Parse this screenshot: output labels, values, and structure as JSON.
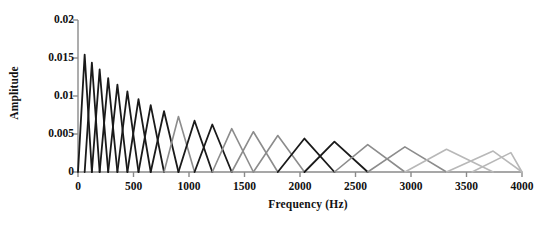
{
  "chart": {
    "title": "",
    "xlabel": "Frequency (Hz)",
    "ylabel": "Amplitude",
    "xticklabels": [
      "0",
      "500",
      "1000",
      "1500",
      "2000",
      "2500",
      "3000",
      "3500",
      "4000"
    ],
    "yticklabels": [
      "0",
      "0.005",
      "0.01",
      "0.015",
      "0.02"
    ]
  },
  "chart_data": {
    "type": "line",
    "title": "",
    "xlabel": "Frequency (Hz)",
    "ylabel": "Amplitude",
    "xlim": [
      0,
      4000
    ],
    "ylim": [
      0,
      0.02
    ],
    "xticks": [
      0,
      500,
      1000,
      1500,
      2000,
      2500,
      3000,
      3500,
      4000
    ],
    "yticks": [
      0,
      0.005,
      0.01,
      0.015,
      0.02
    ],
    "xticklabels": [
      "0",
      "500",
      "1000",
      "1500",
      "2000",
      "2500",
      "3000",
      "3500",
      "4000"
    ],
    "yticklabels": [
      "0",
      "0.005",
      "0.01",
      "0.015",
      "0.02"
    ],
    "grid": false,
    "legend": false,
    "colors": {
      "dark": "#1a1a1a",
      "gray": "#8c8c8c",
      "light_gray": "#b8b8b8",
      "axis": "#8a8a8a",
      "text": "#111111"
    },
    "series": [
      {
        "name": "filter-1",
        "left": 0,
        "center": 60,
        "right": 125,
        "peak": 0.01545,
        "color": "dark"
      },
      {
        "name": "filter-2",
        "left": 60,
        "center": 125,
        "right": 195,
        "peak": 0.0144,
        "color": "dark"
      },
      {
        "name": "filter-3",
        "left": 125,
        "center": 195,
        "right": 272,
        "peak": 0.0135,
        "color": "dark"
      },
      {
        "name": "filter-4",
        "left": 195,
        "center": 272,
        "right": 355,
        "peak": 0.01235,
        "color": "dark"
      },
      {
        "name": "filter-5",
        "left": 272,
        "center": 355,
        "right": 445,
        "peak": 0.0115,
        "color": "dark"
      },
      {
        "name": "filter-6",
        "left": 355,
        "center": 445,
        "right": 545,
        "peak": 0.0106,
        "color": "dark"
      },
      {
        "name": "filter-7",
        "left": 445,
        "center": 545,
        "right": 655,
        "peak": 0.0096,
        "color": "dark"
      },
      {
        "name": "filter-8",
        "left": 545,
        "center": 655,
        "right": 775,
        "peak": 0.0088,
        "color": "dark"
      },
      {
        "name": "filter-9",
        "left": 655,
        "center": 775,
        "right": 905,
        "peak": 0.008,
        "color": "dark"
      },
      {
        "name": "filter-10",
        "left": 775,
        "center": 905,
        "right": 1050,
        "peak": 0.0073,
        "color": "gray"
      },
      {
        "name": "filter-11",
        "left": 905,
        "center": 1050,
        "right": 1210,
        "peak": 0.00675,
        "color": "dark"
      },
      {
        "name": "filter-12",
        "left": 1050,
        "center": 1210,
        "right": 1385,
        "peak": 0.00625,
        "color": "dark"
      },
      {
        "name": "filter-13",
        "left": 1210,
        "center": 1385,
        "right": 1580,
        "peak": 0.0057,
        "color": "gray"
      },
      {
        "name": "filter-14",
        "left": 1385,
        "center": 1580,
        "right": 1800,
        "peak": 0.0053,
        "color": "gray"
      },
      {
        "name": "filter-15",
        "left": 1580,
        "center": 1800,
        "right": 2040,
        "peak": 0.0048,
        "color": "gray"
      },
      {
        "name": "filter-16",
        "left": 1800,
        "center": 2040,
        "right": 2310,
        "peak": 0.0044,
        "color": "dark"
      },
      {
        "name": "filter-17",
        "left": 2040,
        "center": 2310,
        "right": 2610,
        "peak": 0.004,
        "color": "dark"
      },
      {
        "name": "filter-18",
        "left": 2310,
        "center": 2610,
        "right": 2945,
        "peak": 0.0036,
        "color": "gray"
      },
      {
        "name": "filter-19",
        "left": 2610,
        "center": 2945,
        "right": 3320,
        "peak": 0.0033,
        "color": "gray"
      },
      {
        "name": "filter-20",
        "left": 2945,
        "center": 3320,
        "right": 3740,
        "peak": 0.003,
        "color": "light_gray"
      },
      {
        "name": "filter-21",
        "left": 3320,
        "center": 3740,
        "right": 4000,
        "peak": 0.00275,
        "color": "light_gray"
      },
      {
        "name": "filter-22",
        "left": 3550,
        "center": 3900,
        "right": 4000,
        "peak": 0.00255,
        "color": "light_gray"
      }
    ]
  }
}
